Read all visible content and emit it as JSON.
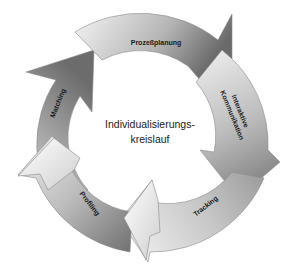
{
  "center": {
    "line1": "Individualisierungs-",
    "line2": "kreislauf"
  },
  "segments": [
    {
      "id": "prozessplanung",
      "label": "Prozeßplanung"
    },
    {
      "id": "interaktive-kommunikation",
      "label_line1": "Interaktive",
      "label_line2": "Kommunikation"
    },
    {
      "id": "tracking",
      "label": "Tracking"
    },
    {
      "id": "profiling",
      "label": "Profiling"
    },
    {
      "id": "matching",
      "label": "Matching"
    }
  ],
  "colors": {
    "arrow_dark": "#6e6e6e",
    "arrow_light": "#f2f2f2",
    "outline": "#8a8a8a",
    "text": "#1a1a1a"
  }
}
